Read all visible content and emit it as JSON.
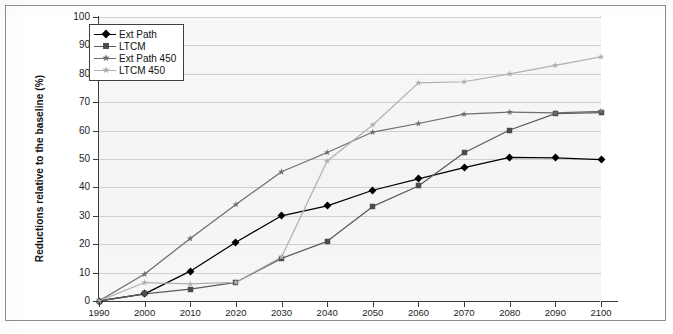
{
  "figure": {
    "background_color": "#ffffff",
    "plot_background_color": "#f7f7f5",
    "grid_color": "#cfcfcf",
    "axis_color": "#3a3a3a"
  },
  "chart_data": {
    "type": "line",
    "title": "",
    "xlabel": "",
    "ylabel": "Reductions relative to the baseline (%)",
    "xlim": [
      1990,
      2100
    ],
    "ylim": [
      0,
      100
    ],
    "grid": true,
    "legend_position": "top-left-inside",
    "x": [
      1990,
      2000,
      2010,
      2020,
      2030,
      2040,
      2050,
      2060,
      2070,
      2080,
      2090,
      2100
    ],
    "xticks": [
      "1990",
      "2000",
      "2010",
      "2020",
      "2030",
      "2040",
      "2050",
      "2060",
      "2070",
      "2080",
      "2090",
      "2100"
    ],
    "yticks": [
      "0",
      "10",
      "20",
      "30",
      "40",
      "50",
      "60",
      "70",
      "80",
      "90",
      "100"
    ],
    "ytick_values": [
      0,
      10,
      20,
      30,
      40,
      50,
      60,
      70,
      80,
      90,
      100
    ],
    "series": [
      {
        "name": "Ext Path",
        "color": "#000000",
        "marker": "diamond",
        "marker_color": "#000000",
        "values": [
          0,
          2.5,
          10.5,
          20.7,
          30.0,
          33.5,
          39.0,
          43.0,
          47.0,
          50.6,
          50.4,
          49.8
        ]
      },
      {
        "name": "LTCM",
        "color": "#5a5a5a",
        "marker": "square",
        "marker_color": "#4b4b4b",
        "values": [
          0,
          2.5,
          4.2,
          6.6,
          15.0,
          21.0,
          33.3,
          40.5,
          52.2,
          60.2,
          66.0,
          66.3
        ]
      },
      {
        "name": "Ext Path 450",
        "color": "#6e6e6e",
        "marker": "star",
        "marker_color": "#6e6e6e",
        "values": [
          0,
          9.5,
          22.0,
          34.0,
          45.5,
          52.3,
          59.5,
          62.5,
          65.8,
          66.5,
          66.2,
          66.8
        ]
      },
      {
        "name": "LTCM 450",
        "color": "#b0b0b0",
        "marker": "star-light",
        "marker_color": "#b0b0b0",
        "values": [
          0,
          6.5,
          6.0,
          6.6,
          15.5,
          49.3,
          62.0,
          76.8,
          77.2,
          80.0,
          83.0,
          86.0
        ]
      }
    ]
  },
  "legend": {
    "items": [
      {
        "label": "Ext Path"
      },
      {
        "label": "LTCM"
      },
      {
        "label": "Ext Path 450"
      },
      {
        "label": "LTCM 450"
      }
    ]
  }
}
